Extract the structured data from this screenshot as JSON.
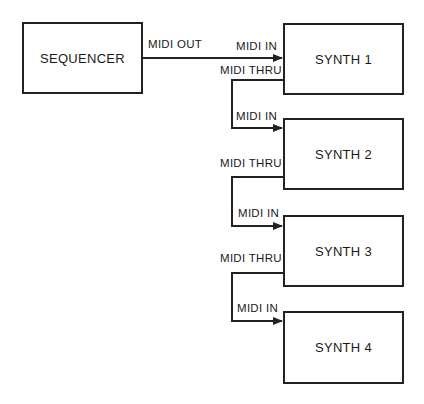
{
  "nodes": [
    {
      "id": "sequencer",
      "label": "SEQUENCER"
    },
    {
      "id": "synth1",
      "label": "SYNTH 1"
    },
    {
      "id": "synth2",
      "label": "SYNTH 2"
    },
    {
      "id": "synth3",
      "label": "SYNTH 3"
    },
    {
      "id": "synth4",
      "label": "SYNTH 4"
    }
  ],
  "edges": [
    {
      "from": "sequencer",
      "to": "synth1",
      "out_label": "MIDI OUT",
      "in_label": "MIDI IN"
    },
    {
      "from": "synth1",
      "to": "synth2",
      "out_label": "MIDI THRU",
      "in_label": "MIDI IN"
    },
    {
      "from": "synth2",
      "to": "synth3",
      "out_label": "MIDI THRU",
      "in_label": "MIDI IN"
    },
    {
      "from": "synth3",
      "to": "synth4",
      "out_label": "MIDI THRU",
      "in_label": "MIDI IN"
    }
  ],
  "colors": {
    "line": "#222222",
    "background": "#ffffff"
  }
}
